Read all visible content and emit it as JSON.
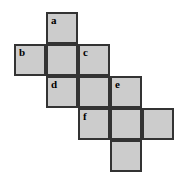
{
  "figure": {
    "kind": "cube-net-diagram",
    "grid": {
      "origin_x": 14,
      "origin_y": 12,
      "cell_size": 32
    },
    "style": {
      "fill_color": "#cccccc",
      "border_color": "#333333",
      "background_color": "#ffffff",
      "label_color": "#000000"
    },
    "squares": [
      {
        "label": "a",
        "col": 1,
        "row": 0
      },
      {
        "label": "b",
        "col": 0,
        "row": 1
      },
      {
        "label": "",
        "col": 1,
        "row": 1
      },
      {
        "label": "c",
        "col": 2,
        "row": 1
      },
      {
        "label": "d",
        "col": 1,
        "row": 2
      },
      {
        "label": "",
        "col": 2,
        "row": 2
      },
      {
        "label": "e",
        "col": 3,
        "row": 2
      },
      {
        "label": "f",
        "col": 2,
        "row": 3
      },
      {
        "label": "",
        "col": 3,
        "row": 3
      },
      {
        "label": "",
        "col": 4,
        "row": 3
      },
      {
        "label": "",
        "col": 3,
        "row": 4
      }
    ]
  }
}
